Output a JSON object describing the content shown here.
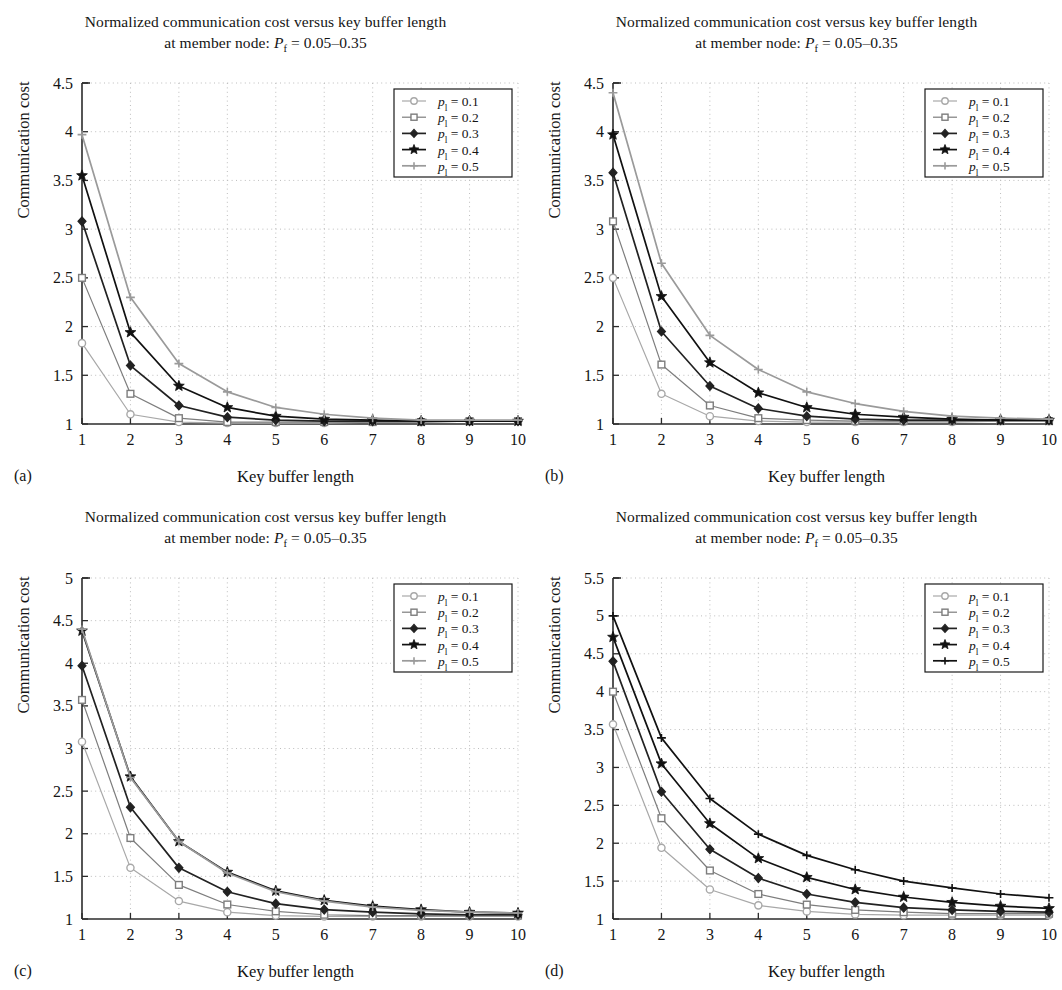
{
  "figure": {
    "title_line1": "Normalized communication cost versus key buffer length",
    "title_line2_prefix": "at member node: ",
    "title_line2_symbol": "P",
    "title_line2_sub": "f",
    "title_line2_value": " = 0.05–0.35",
    "xlabel": "Key buffer length",
    "ylabel": "Communication cost",
    "series_colors": [
      "#a8a8a8",
      "#7d7d7d",
      "#222222",
      "#111111",
      "#9a9a9a"
    ],
    "marker_names": [
      "circle-marker",
      "square-marker",
      "diamond-marker",
      "star-marker",
      "plus-marker"
    ]
  },
  "panels": [
    {
      "label": "(a)",
      "name": "panel-a",
      "chart_data": {
        "type": "line",
        "title": "Normalized communication cost versus key buffer length at member node: Pf = 0.05–0.35",
        "xlabel": "Key buffer length",
        "ylabel": "Communication cost",
        "x": [
          1,
          2,
          3,
          4,
          5,
          6,
          7,
          8,
          9,
          10
        ],
        "xlim": [
          1,
          10
        ],
        "ylim": [
          1,
          4.5
        ],
        "xticks": [
          1,
          2,
          3,
          4,
          5,
          6,
          7,
          8,
          9,
          10
        ],
        "yticks": [
          1,
          1.5,
          2,
          2.5,
          3,
          3.5,
          4,
          4.5
        ],
        "ytick_labels": [
          "1",
          "1.5",
          "2",
          "2.5",
          "3",
          "3.5",
          "4",
          "4.5"
        ],
        "grid": true,
        "legend_position": "upper right",
        "series": [
          {
            "name": "p1 = 0.1",
            "marker": "circle",
            "color": "#a8a8a8",
            "values": [
              1.83,
              1.1,
              1.02,
              1.01,
              1.01,
              1.01,
              1.02,
              1.02,
              1.03,
              1.03
            ]
          },
          {
            "name": "p1 = 0.2",
            "marker": "square",
            "color": "#7d7d7d",
            "values": [
              2.5,
              1.31,
              1.06,
              1.02,
              1.02,
              1.02,
              1.02,
              1.02,
              1.03,
              1.03
            ]
          },
          {
            "name": "p1 = 0.3",
            "marker": "diamond",
            "color": "#222222",
            "values": [
              3.08,
              1.6,
              1.19,
              1.07,
              1.04,
              1.03,
              1.03,
              1.03,
              1.03,
              1.03
            ]
          },
          {
            "name": "p1 = 0.4",
            "marker": "star",
            "color": "#111111",
            "values": [
              3.55,
              1.94,
              1.39,
              1.17,
              1.08,
              1.05,
              1.04,
              1.03,
              1.03,
              1.03
            ]
          },
          {
            "name": "p1 = 0.5",
            "marker": "plus",
            "color": "#9a9a9a",
            "values": [
              3.97,
              2.3,
              1.62,
              1.33,
              1.17,
              1.1,
              1.06,
              1.04,
              1.04,
              1.04
            ]
          }
        ]
      }
    },
    {
      "label": "(b)",
      "name": "panel-b",
      "chart_data": {
        "type": "line",
        "title": "Normalized communication cost versus key buffer length at member node: Pf = 0.05–0.35",
        "xlabel": "Key buffer length",
        "ylabel": "Communication cost",
        "x": [
          1,
          2,
          3,
          4,
          5,
          6,
          7,
          8,
          9,
          10
        ],
        "xlim": [
          1,
          10
        ],
        "ylim": [
          1,
          4.5
        ],
        "xticks": [
          1,
          2,
          3,
          4,
          5,
          6,
          7,
          8,
          9,
          10
        ],
        "yticks": [
          1,
          1.5,
          2,
          2.5,
          3,
          3.5,
          4,
          4.5
        ],
        "ytick_labels": [
          "1",
          "1.5",
          "2",
          "2.5",
          "3",
          "3.5",
          "4",
          "4.5"
        ],
        "grid": true,
        "legend_position": "upper right",
        "series": [
          {
            "name": "p1 = 0.1",
            "marker": "circle",
            "color": "#a8a8a8",
            "values": [
              2.5,
              1.31,
              1.08,
              1.03,
              1.02,
              1.02,
              1.02,
              1.02,
              1.03,
              1.03
            ]
          },
          {
            "name": "p1 = 0.2",
            "marker": "square",
            "color": "#7d7d7d",
            "values": [
              3.08,
              1.61,
              1.19,
              1.06,
              1.04,
              1.03,
              1.03,
              1.03,
              1.03,
              1.03
            ]
          },
          {
            "name": "p1 = 0.3",
            "marker": "diamond",
            "color": "#222222",
            "values": [
              3.58,
              1.95,
              1.39,
              1.16,
              1.08,
              1.05,
              1.04,
              1.04,
              1.04,
              1.04
            ]
          },
          {
            "name": "p1 = 0.4",
            "marker": "star",
            "color": "#111111",
            "values": [
              3.97,
              2.31,
              1.63,
              1.32,
              1.17,
              1.1,
              1.07,
              1.05,
              1.04,
              1.04
            ]
          },
          {
            "name": "p1 = 0.5",
            "marker": "plus",
            "color": "#9a9a9a",
            "values": [
              4.4,
              2.65,
              1.91,
              1.56,
              1.33,
              1.21,
              1.13,
              1.08,
              1.06,
              1.05
            ]
          }
        ]
      }
    },
    {
      "label": "(c)",
      "name": "panel-c",
      "chart_data": {
        "type": "line",
        "title": "Normalized communication cost versus key buffer length at member node: Pf = 0.05–0.35",
        "xlabel": "Key buffer length",
        "ylabel": "Communication cost",
        "x": [
          1,
          2,
          3,
          4,
          5,
          6,
          7,
          8,
          9,
          10
        ],
        "xlim": [
          1,
          10
        ],
        "ylim": [
          1,
          5
        ],
        "xticks": [
          1,
          2,
          3,
          4,
          5,
          6,
          7,
          8,
          9,
          10
        ],
        "yticks": [
          1,
          1.5,
          2,
          2.5,
          3,
          3.5,
          4,
          4.5,
          5
        ],
        "ytick_labels": [
          "1",
          "1.5",
          "2",
          "2.5",
          "3",
          "3.5",
          "4",
          "4.5",
          "5"
        ],
        "grid": true,
        "legend_position": "upper right",
        "series": [
          {
            "name": "p1 = 0.1",
            "marker": "circle",
            "color": "#a8a8a8",
            "values": [
              3.08,
              1.6,
              1.21,
              1.08,
              1.04,
              1.03,
              1.03,
              1.03,
              1.03,
              1.03
            ]
          },
          {
            "name": "p1 = 0.2",
            "marker": "square",
            "color": "#7d7d7d",
            "values": [
              3.57,
              1.95,
              1.4,
              1.17,
              1.09,
              1.05,
              1.04,
              1.04,
              1.04,
              1.04
            ]
          },
          {
            "name": "p1 = 0.3",
            "marker": "diamond",
            "color": "#222222",
            "values": [
              3.97,
              2.31,
              1.6,
              1.32,
              1.18,
              1.11,
              1.08,
              1.06,
              1.05,
              1.05
            ]
          },
          {
            "name": "p1 = 0.4",
            "marker": "star",
            "color": "#111111",
            "values": [
              4.38,
              2.67,
              1.91,
              1.55,
              1.33,
              1.22,
              1.15,
              1.11,
              1.08,
              1.07
            ]
          },
          {
            "name": "p1 = 0.5",
            "marker": "plus",
            "color": "#9a9a9a",
            "values": [
              4.4,
              2.66,
              1.91,
              1.54,
              1.32,
              1.21,
              1.14,
              1.1,
              1.08,
              1.07
            ]
          }
        ]
      }
    },
    {
      "label": "(d)",
      "name": "panel-d",
      "chart_data": {
        "type": "line",
        "title": "Normalized communication cost versus key buffer length at member node: Pf = 0.05–0.35",
        "xlabel": "Key buffer length",
        "ylabel": "Communication cost",
        "x": [
          1,
          2,
          3,
          4,
          5,
          6,
          7,
          8,
          9,
          10
        ],
        "xlim": [
          1,
          10
        ],
        "ylim": [
          1,
          5.5
        ],
        "xticks": [
          1,
          2,
          3,
          4,
          5,
          6,
          7,
          8,
          9,
          10
        ],
        "yticks": [
          1,
          1.5,
          2,
          2.5,
          3,
          3.5,
          4,
          4.5,
          5,
          5.5
        ],
        "ytick_labels": [
          "1",
          "1.5",
          "2",
          "2.5",
          "3",
          "3.5",
          "4",
          "4.5",
          "5",
          "5.5"
        ],
        "grid": true,
        "legend_position": "upper right",
        "series": [
          {
            "name": "p1 = 0.1",
            "marker": "circle",
            "color": "#a8a8a8",
            "values": [
              3.57,
              1.94,
              1.39,
              1.18,
              1.1,
              1.06,
              1.05,
              1.05,
              1.05,
              1.05
            ]
          },
          {
            "name": "p1 = 0.2",
            "marker": "square",
            "color": "#7d7d7d",
            "values": [
              4.0,
              2.33,
              1.64,
              1.33,
              1.19,
              1.12,
              1.09,
              1.07,
              1.07,
              1.07
            ]
          },
          {
            "name": "p1 = 0.3",
            "marker": "diamond",
            "color": "#222222",
            "values": [
              4.4,
              2.68,
              1.92,
              1.54,
              1.33,
              1.22,
              1.15,
              1.12,
              1.1,
              1.09
            ]
          },
          {
            "name": "p1 = 0.4",
            "marker": "star",
            "color": "#111111",
            "values": [
              4.72,
              3.05,
              2.26,
              1.8,
              1.55,
              1.39,
              1.29,
              1.22,
              1.17,
              1.14
            ]
          },
          {
            "name": "p1 = 0.5",
            "marker": "plus",
            "color": "#111111",
            "values": [
              5.0,
              3.39,
              2.59,
              2.12,
              1.84,
              1.65,
              1.5,
              1.41,
              1.33,
              1.28
            ]
          }
        ]
      }
    }
  ],
  "legend": {
    "entries": [
      {
        "symbol": "p",
        "sub": "l",
        "value": " = 0.1"
      },
      {
        "symbol": "p",
        "sub": "l",
        "value": " = 0.2"
      },
      {
        "symbol": "p",
        "sub": "l",
        "value": " = 0.3"
      },
      {
        "symbol": "p",
        "sub": "l",
        "value": " = 0.4"
      },
      {
        "symbol": "p",
        "sub": "l",
        "value": " = 0.5"
      }
    ]
  }
}
